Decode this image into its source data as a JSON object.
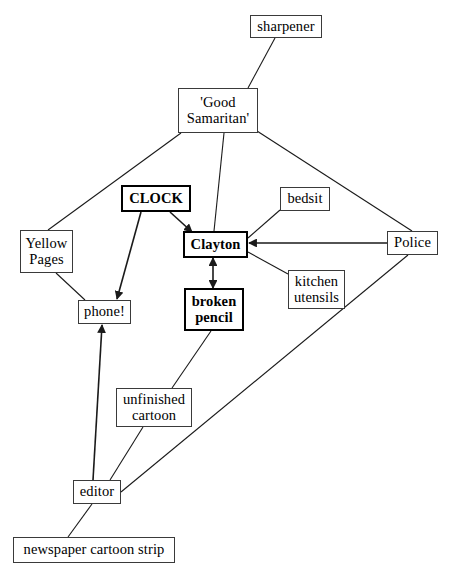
{
  "diagram": {
    "background_color": "#ffffff",
    "line_color": "#1a1a1a",
    "text_color": "#000000",
    "nodes": [
      {
        "id": "sharpener",
        "label": "sharpener",
        "x": 250,
        "y": 15,
        "w": 72,
        "h": 23,
        "emphasis": "normal"
      },
      {
        "id": "good-samaritan",
        "label": "'Good\nSamaritan'",
        "x": 178,
        "y": 88,
        "w": 80,
        "h": 45,
        "emphasis": "normal"
      },
      {
        "id": "clock",
        "label": "CLOCK",
        "x": 121,
        "y": 185,
        "w": 70,
        "h": 27,
        "emphasis": "bold"
      },
      {
        "id": "bedsit",
        "label": "bedsit",
        "x": 280,
        "y": 187,
        "w": 50,
        "h": 24,
        "emphasis": "normal"
      },
      {
        "id": "yellow-pages",
        "label": "Yellow\nPages",
        "x": 20,
        "y": 230,
        "w": 53,
        "h": 43,
        "emphasis": "normal"
      },
      {
        "id": "clayton",
        "label": "Clayton",
        "x": 183,
        "y": 231,
        "w": 65,
        "h": 27,
        "emphasis": "bold"
      },
      {
        "id": "police",
        "label": "Police",
        "x": 387,
        "y": 231,
        "w": 51,
        "h": 24,
        "emphasis": "normal"
      },
      {
        "id": "kitchen-utensils",
        "label": "kitchen\nutensils",
        "x": 288,
        "y": 270,
        "w": 57,
        "h": 39,
        "emphasis": "normal"
      },
      {
        "id": "broken-pencil",
        "label": "broken\npencil",
        "x": 184,
        "y": 288,
        "w": 60,
        "h": 43,
        "emphasis": "bold"
      },
      {
        "id": "phone",
        "label": "phone!",
        "x": 78,
        "y": 300,
        "w": 53,
        "h": 24,
        "emphasis": "normal"
      },
      {
        "id": "unfinished-cartoon",
        "label": "unfinished\ncartoon",
        "x": 116,
        "y": 388,
        "w": 76,
        "h": 39,
        "emphasis": "normal"
      },
      {
        "id": "editor",
        "label": "editor",
        "x": 73,
        "y": 480,
        "w": 48,
        "h": 24,
        "emphasis": "normal"
      },
      {
        "id": "newspaper-cartoon-strip",
        "label": "newspaper cartoon strip",
        "x": 13,
        "y": 537,
        "w": 162,
        "h": 26,
        "emphasis": "normal"
      }
    ],
    "edges": [
      {
        "id": "sharpener-good-samaritan",
        "from": "sharpener",
        "to": "good-samaritan",
        "x1": 275,
        "y1": 38,
        "x2": 248,
        "y2": 88,
        "arrow": "none"
      },
      {
        "id": "good-samaritan-clayton",
        "from": "good-samaritan",
        "to": "clayton",
        "x1": 224,
        "y1": 133,
        "x2": 214,
        "y2": 231,
        "arrow": "none"
      },
      {
        "id": "good-samaritan-yellow-pages",
        "from": "good-samaritan",
        "to": "yellow-pages",
        "x1": 181,
        "y1": 133,
        "x2": 48,
        "y2": 230,
        "arrow": "none"
      },
      {
        "id": "good-samaritan-police",
        "from": "good-samaritan",
        "to": "police",
        "x1": 257,
        "y1": 131,
        "x2": 412,
        "y2": 231,
        "arrow": "none"
      },
      {
        "id": "clock-clayton",
        "from": "clock",
        "to": "clayton",
        "x1": 170,
        "y1": 212,
        "x2": 192,
        "y2": 232,
        "arrow": "end"
      },
      {
        "id": "clock-phone",
        "from": "clock",
        "to": "phone",
        "x1": 141,
        "y1": 212,
        "x2": 117,
        "y2": 299,
        "arrow": "end"
      },
      {
        "id": "bedsit-clayton",
        "from": "bedsit",
        "to": "clayton",
        "x1": 280,
        "y1": 210,
        "x2": 248,
        "y2": 238,
        "arrow": "none"
      },
      {
        "id": "police-clayton",
        "from": "police",
        "to": "clayton",
        "x1": 387,
        "y1": 243,
        "x2": 249,
        "y2": 243,
        "arrow": "end"
      },
      {
        "id": "kitchen-utensils-clayton",
        "from": "kitchen-utensils",
        "to": "clayton",
        "x1": 288,
        "y1": 274,
        "x2": 248,
        "y2": 252,
        "arrow": "none"
      },
      {
        "id": "clayton-broken-pencil",
        "from": "clayton",
        "to": "broken-pencil",
        "x1": 213,
        "y1": 258,
        "x2": 213,
        "y2": 288,
        "arrow": "both"
      },
      {
        "id": "yellow-pages-phone",
        "from": "yellow-pages",
        "to": "phone",
        "x1": 56,
        "y1": 273,
        "x2": 85,
        "y2": 300,
        "arrow": "none"
      },
      {
        "id": "broken-pencil-unfinished-cartoon",
        "from": "broken-pencil",
        "to": "unfinished-cartoon",
        "x1": 211,
        "y1": 331,
        "x2": 172,
        "y2": 388,
        "arrow": "none"
      },
      {
        "id": "unfinished-cartoon-editor",
        "from": "unfinished-cartoon",
        "to": "editor",
        "x1": 143,
        "y1": 427,
        "x2": 110,
        "y2": 480,
        "arrow": "none"
      },
      {
        "id": "editor-phone",
        "from": "editor",
        "to": "phone",
        "x1": 93,
        "y1": 480,
        "x2": 102,
        "y2": 325,
        "arrow": "end"
      },
      {
        "id": "editor-police",
        "from": "editor",
        "to": "police",
        "x1": 121,
        "y1": 492,
        "x2": 408,
        "y2": 255,
        "arrow": "none"
      },
      {
        "id": "editor-newspaper-cartoon-strip",
        "from": "editor",
        "to": "newspaper-cartoon-strip",
        "x1": 92,
        "y1": 504,
        "x2": 68,
        "y2": 537,
        "arrow": "none"
      }
    ]
  }
}
